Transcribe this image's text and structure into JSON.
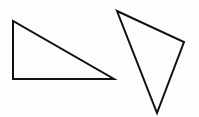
{
  "figure": {
    "canvas": {
      "width": 199,
      "height": 117,
      "background_color": "#fdfdfd"
    },
    "style": {
      "stroke_color": "#111111",
      "stroke_width": 2,
      "fill": "none"
    },
    "shapes": [
      {
        "name": "left-triangle",
        "kind": "right-triangle",
        "description": "Right triangle with the right angle at the lower-left, hypotenuse descending left-to-right",
        "vertices": [
          [
            13,
            21
          ],
          [
            13,
            79
          ],
          [
            114,
            79
          ]
        ],
        "points_attr": "13,21 13,79 114,79"
      },
      {
        "name": "right-triangle",
        "kind": "scalene-triangle",
        "description": "Tilted scalene triangle pointing downward, apex at top-left, long vertex at bottom",
        "vertices": [
          [
            117,
            11
          ],
          [
            184,
            42
          ],
          [
            157,
            113
          ]
        ],
        "points_attr": "117,11 184,42 157,113"
      }
    ]
  },
  "chart_data": {
    "type": "scatter",
    "xlabel": "",
    "ylabel": "",
    "xlim": [
      0,
      199
    ],
    "ylim": [
      0,
      117
    ],
    "grid": false,
    "legend": "none",
    "series": [
      {
        "name": "left-triangle",
        "closed": true,
        "x": [
          13,
          13,
          114,
          13
        ],
        "y": [
          21,
          79,
          79,
          21
        ]
      },
      {
        "name": "right-triangle",
        "closed": true,
        "x": [
          117,
          184,
          157,
          117
        ],
        "y": [
          11,
          42,
          113,
          11
        ]
      }
    ]
  }
}
